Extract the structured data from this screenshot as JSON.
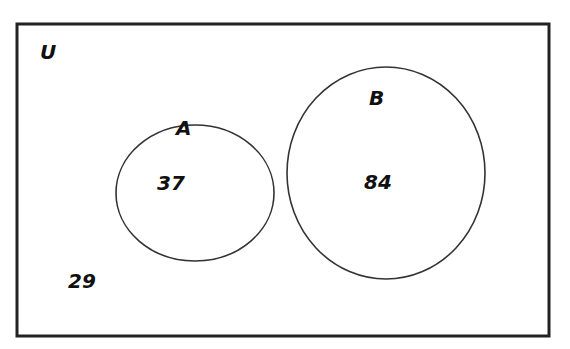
{
  "diagram": {
    "type": "venn",
    "universe_label": "U",
    "sets": [
      {
        "label": "A",
        "value": "37"
      },
      {
        "label": "B",
        "value": "84"
      }
    ],
    "outside_value": "29",
    "colors": {
      "stroke": "#222222",
      "background": "#ffffff"
    }
  }
}
